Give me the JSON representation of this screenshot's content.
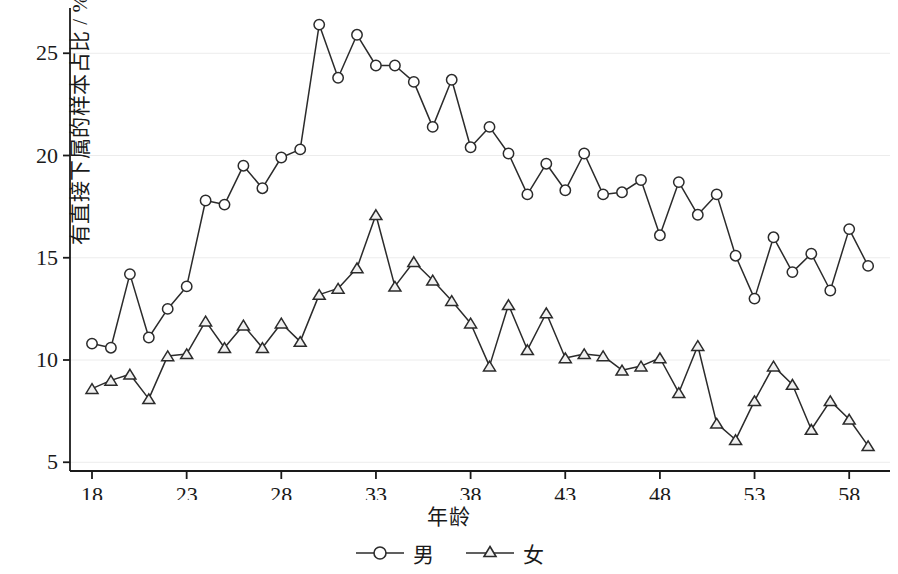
{
  "chart_data": {
    "type": "line",
    "title": "",
    "xlabel": "年龄",
    "ylabel": "有直接下属的样本占比 / %",
    "xlim": [
      18,
      59
    ],
    "ylim": [
      4.2,
      27.2
    ],
    "xticks": [
      18,
      23,
      28,
      33,
      38,
      43,
      48,
      53,
      58
    ],
    "yticks": [
      5,
      10,
      15,
      20,
      25
    ],
    "grid": "horizontal-light",
    "legend_position": "bottom-center",
    "x": [
      18,
      19,
      20,
      21,
      22,
      23,
      24,
      25,
      26,
      27,
      28,
      29,
      30,
      31,
      32,
      33,
      34,
      35,
      36,
      37,
      38,
      39,
      40,
      41,
      42,
      43,
      44,
      45,
      46,
      47,
      48,
      49,
      50,
      51,
      52,
      53,
      54,
      55,
      56,
      57,
      58,
      59
    ],
    "series": [
      {
        "name": "男",
        "marker": "circle",
        "values": [
          10.8,
          10.6,
          14.2,
          11.1,
          12.5,
          13.6,
          17.8,
          17.6,
          19.5,
          18.4,
          19.9,
          20.3,
          26.4,
          23.8,
          25.9,
          24.4,
          24.4,
          23.6,
          21.4,
          23.7,
          20.4,
          21.4,
          20.1,
          18.1,
          19.6,
          18.3,
          20.1,
          18.1,
          18.2,
          18.8,
          16.1,
          18.7,
          17.1,
          18.1,
          15.1,
          13.0,
          16.0,
          14.3,
          15.2,
          13.4,
          16.4,
          14.6
        ]
      },
      {
        "name": "女",
        "marker": "triangle",
        "values": [
          8.6,
          9.0,
          9.3,
          8.1,
          10.2,
          10.3,
          11.9,
          10.6,
          11.7,
          10.6,
          11.8,
          10.9,
          13.2,
          13.5,
          14.5,
          17.1,
          13.6,
          14.8,
          13.9,
          12.9,
          11.8,
          9.7,
          12.7,
          10.5,
          12.3,
          10.1,
          10.3,
          10.2,
          9.5,
          9.7,
          10.1,
          8.4,
          10.7,
          6.9,
          6.1,
          8.0,
          9.7,
          8.8,
          6.6,
          8.0,
          7.1,
          5.8
        ]
      }
    ]
  },
  "axis": {
    "ylabel_text": "有直接下属的样本占比 / %",
    "xlabel_text": "年龄",
    "ytick_labels": [
      "5",
      "10",
      "15",
      "20",
      "25"
    ],
    "xtick_labels": [
      "18",
      "23",
      "28",
      "33",
      "38",
      "43",
      "48",
      "53",
      "58"
    ]
  },
  "legend": {
    "items": [
      {
        "label": "男",
        "marker": "circle-marker"
      },
      {
        "label": "女",
        "marker": "triangle-marker"
      }
    ]
  },
  "style": {
    "line_color": "#2b2b2b",
    "grid_color": "#ececec",
    "axis_color": "#1a1a1a",
    "background": "#ffffff"
  }
}
